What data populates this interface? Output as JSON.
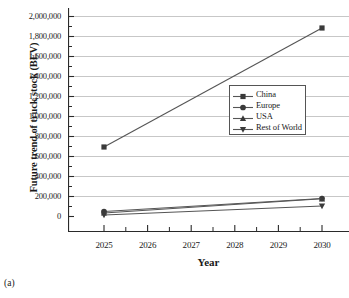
{
  "caption": "(a)",
  "chart_data": {
    "type": "line",
    "title": "",
    "xlabel": "Year",
    "ylabel": "Future trend of truck stock (BEV)",
    "x": [
      2025,
      2030
    ],
    "categories": [
      "2025",
      "2030"
    ],
    "xlim": [
      2025,
      2030
    ],
    "ylim": [
      0,
      2000000
    ],
    "xticks": [
      "2025",
      "2026",
      "2027",
      "2028",
      "2029",
      "2030"
    ],
    "yticks": [
      "0",
      "200,000",
      "400,000",
      "600,000",
      "800,000",
      "1,000,000",
      "1,200,000",
      "1,400,000",
      "1,600,000",
      "1,800,000",
      "2,000,000"
    ],
    "grid": "horizontal",
    "legend_position": "center-right",
    "series": [
      {
        "name": "China",
        "marker": "square",
        "values": [
          690000,
          1880000
        ]
      },
      {
        "name": "Europe",
        "marker": "circle",
        "values": [
          45000,
          175000
        ]
      },
      {
        "name": "USA",
        "marker": "triangle-up",
        "values": [
          30000,
          172000
        ]
      },
      {
        "name": "Rest of World",
        "marker": "triangle-down",
        "values": [
          10000,
          100000
        ]
      }
    ]
  },
  "legend": {
    "items": [
      {
        "label": "China"
      },
      {
        "label": "Europe"
      },
      {
        "label": "USA"
      },
      {
        "label": "Rest of World"
      }
    ]
  },
  "colors": {
    "line": "#555555",
    "marker": "#3a3a3a",
    "grid": "#b9b9b9",
    "axis": "#2a2a2a"
  }
}
